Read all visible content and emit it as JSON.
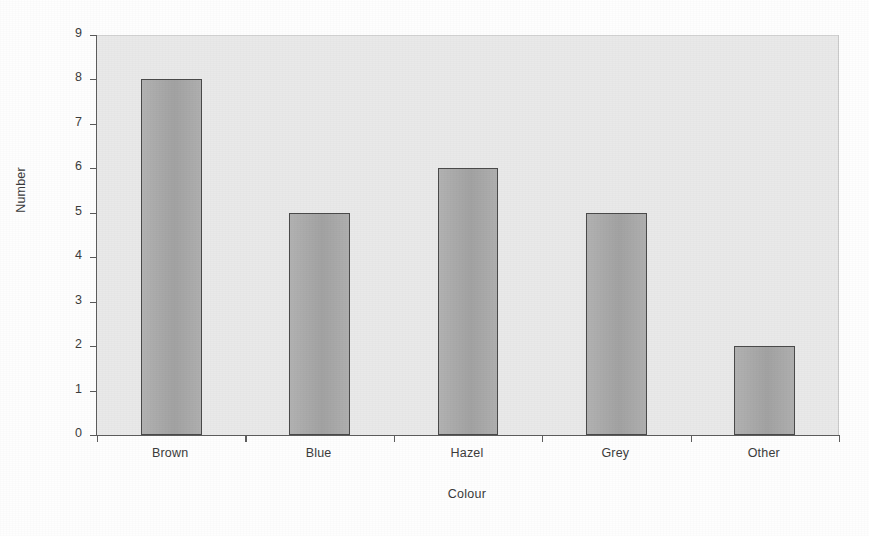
{
  "chart_data": {
    "type": "bar",
    "title": "",
    "subtitle": "",
    "xlabel": "Colour",
    "ylabel": "Number",
    "categories": [
      "Brown",
      "Blue",
      "Hazel",
      "Grey",
      "Other"
    ],
    "values": [
      8,
      5,
      6,
      5,
      2
    ],
    "series": [
      {
        "name": "Number",
        "values": [
          8,
          5,
          6,
          5,
          2
        ]
      }
    ],
    "ylim": [
      0,
      9
    ],
    "ytick_labels": [
      "0",
      "1",
      "2",
      "3",
      "4",
      "5",
      "6",
      "7",
      "8",
      "9"
    ],
    "ytick_values": [
      0,
      1,
      2,
      3,
      4,
      5,
      6,
      7,
      8,
      9
    ],
    "ytick_interval": 1,
    "grid": false,
    "legend": "none",
    "legend_position": "none",
    "annotations": [],
    "x_tick_placement": "category-boundaries",
    "colors": {
      "bar_fill": "#a9a9a9",
      "bar_outline": "#4a4a4a",
      "plot_background": "#e9e9e9",
      "axis_line": "#5d5d5d",
      "text": "#3c3c3c",
      "page_background": "#fefefe"
    }
  }
}
